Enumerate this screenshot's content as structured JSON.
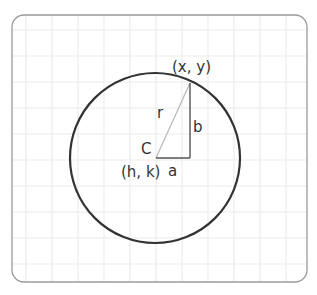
{
  "diagram": {
    "colors": {
      "frame": "#9a9a9a",
      "grid": "#ececec",
      "circle": "#333333",
      "radius_line": "#b8b8b8",
      "legs": "#555555",
      "text": "#333333"
    },
    "labels": {
      "point": "(x, y)",
      "radius": "r",
      "vertical_leg": "b",
      "center_letter": "C",
      "center_coords": "(h, k)",
      "horizontal_leg": "a"
    },
    "geometry": {
      "frame": {
        "x": 12,
        "y": 15,
        "width": 295,
        "height": 267,
        "radius": 12
      },
      "grid_spacing": 26,
      "circle": {
        "cx": 155,
        "cy": 158,
        "r": 85
      },
      "point": {
        "x": 190,
        "y": 83
      },
      "right_angle": {
        "x": 190,
        "y": 158
      }
    }
  }
}
